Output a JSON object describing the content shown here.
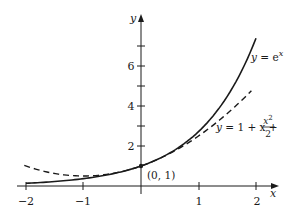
{
  "chart_data": {
    "type": "line",
    "title": "",
    "xlabel": "x",
    "ylabel": "y",
    "xlim": [
      -2,
      2
    ],
    "ylim": [
      0,
      7.4
    ],
    "grid": false,
    "x_ticks": [
      -2,
      -1,
      1,
      2
    ],
    "x_tick_labels": [
      "−2",
      "−1",
      "1",
      "2"
    ],
    "y_ticks": [
      1,
      2,
      3,
      4,
      5,
      6,
      7
    ],
    "y_tick_labels": [
      "",
      "2",
      "",
      "4",
      "",
      "6",
      ""
    ],
    "series": [
      {
        "name": "y = e^x",
        "style": "solid",
        "color": "#1a1a1a",
        "x": [
          -2,
          -1.5,
          -1,
          -0.5,
          0,
          0.5,
          1,
          1.5,
          2
        ],
        "values": [
          0.135,
          0.223,
          0.368,
          0.607,
          1.0,
          1.649,
          2.718,
          4.482,
          7.389
        ]
      },
      {
        "name": "y = 1 + x + x^2/2",
        "style": "dashed",
        "color": "#1a1a1a",
        "x": [
          -2,
          -1.5,
          -1,
          -0.5,
          0,
          0.5,
          1,
          1.5,
          2
        ],
        "values": [
          1.0,
          0.625,
          0.5,
          0.625,
          1.0,
          1.625,
          2.5,
          3.625,
          5.0
        ]
      }
    ],
    "annotations": [
      {
        "text": "(0, 1)",
        "x": 0,
        "y": 1
      },
      {
        "text": "y = e^x",
        "target": "solid curve"
      },
      {
        "text": "y = 1 + x + x²/2",
        "target": "dashed curve"
      }
    ]
  },
  "labels": {
    "x_axis": "x",
    "y_axis": "y",
    "point": "(0, 1)",
    "xt_m2": "−2",
    "xt_m1": "−1",
    "xt_1": "1",
    "xt_2": "2",
    "yt_2": "2",
    "yt_4": "4",
    "yt_6": "6",
    "exp_y": "y",
    "exp_eq": " = e",
    "exp_sup": "x",
    "poly_y": "y",
    "poly_eq": " = 1 + x + ",
    "poly_num": "x",
    "poly_num_sup": "2",
    "poly_den": "2"
  }
}
